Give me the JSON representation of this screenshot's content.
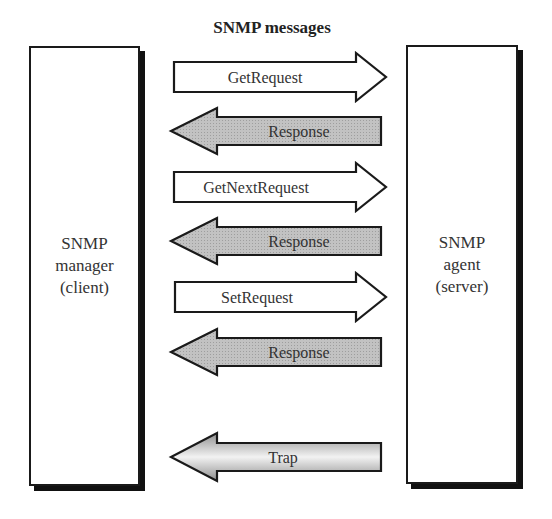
{
  "diagram": {
    "title": "SNMP messages",
    "manager": {
      "line1": "SNMP",
      "line2": "manager",
      "line3": "(client)"
    },
    "agent": {
      "line1": "SNMP",
      "line2": "agent",
      "line3": "(server)"
    },
    "messages": [
      {
        "label": "GetRequest",
        "direction": "manager-to-agent",
        "style": "white"
      },
      {
        "label": "Response",
        "direction": "agent-to-manager",
        "style": "gray"
      },
      {
        "label": "GetNextRequest",
        "direction": "manager-to-agent",
        "style": "white"
      },
      {
        "label": "Response",
        "direction": "agent-to-manager",
        "style": "gray"
      },
      {
        "label": "SetRequest",
        "direction": "manager-to-agent",
        "style": "white"
      },
      {
        "label": "Response",
        "direction": "agent-to-manager",
        "style": "gray"
      },
      {
        "label": "Trap",
        "direction": "agent-to-manager",
        "style": "gradient"
      }
    ],
    "colors": {
      "outline": "#1a1a1a",
      "gray_fill": "#bdbdbd",
      "white_fill": "#ffffff",
      "shadow": "#111111"
    }
  }
}
